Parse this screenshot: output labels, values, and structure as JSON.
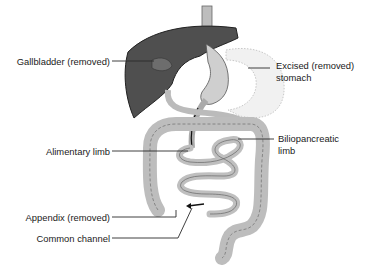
{
  "diagram": {
    "labels": {
      "gallbladder": "Gallbladder (removed)",
      "stomach_line1": "Excised (removed)",
      "stomach_line2": "stomach",
      "alimentary": "Alimentary limb",
      "biliopancreatic_line1": "Biliopancreatic",
      "biliopancreatic_line2": "limb",
      "appendix": "Appendix (removed)",
      "common_channel": "Common channel"
    },
    "colors": {
      "liver": "#4a4a4a",
      "bowel": "#c8c8c8",
      "excised_stomach": "#f0f0f0",
      "leader_line": "#2a2a2a"
    }
  }
}
